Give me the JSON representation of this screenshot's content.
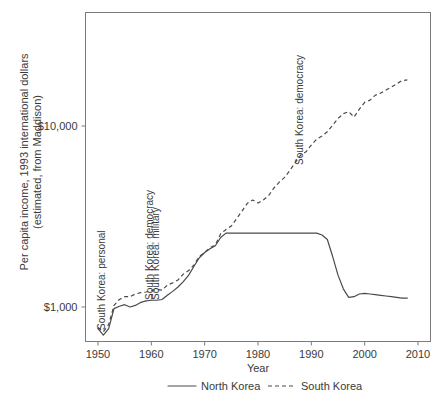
{
  "chart_data": {
    "type": "line",
    "title": "",
    "xlabel": "Year",
    "ylabel": "Per capita income, 1993 international dollars (estimated, from Maddison)",
    "ylabel_line1": "Per capita income, 1993 international dollars",
    "ylabel_line2": "(estimated, from Maddison)",
    "yscale": "log",
    "xlim": [
      1948,
      2012
    ],
    "ylim": [
      600,
      30000
    ],
    "grid": false,
    "legend_position": "bottom",
    "xticks": [
      1950,
      1960,
      1970,
      1980,
      1990,
      2000,
      2010
    ],
    "xticklabels": [
      "1950",
      "1960",
      "1970",
      "1980",
      "1990",
      "2000",
      "2010"
    ],
    "yticks": [
      1000,
      10000
    ],
    "yticklabels": [
      "$1,000",
      "$10,000"
    ],
    "legend": [
      {
        "name": "North Korea",
        "style": "solid"
      },
      {
        "name": "South Korea",
        "style": "dashed"
      }
    ],
    "annotations": [
      {
        "text": "South Korea: personal",
        "year": 1951,
        "rotation": -90
      },
      {
        "text": "South Korea: democracy",
        "year": 1960,
        "rotation": -90
      },
      {
        "text": "South Korea: military",
        "year": 1961,
        "rotation": -90
      },
      {
        "text": "South Korea: democracy",
        "year": 1988,
        "rotation": -90
      }
    ],
    "series": [
      {
        "name": "North Korea",
        "style": "solid",
        "x": [
          1950,
          1951,
          1952,
          1953,
          1954,
          1955,
          1956,
          1957,
          1958,
          1959,
          1960,
          1961,
          1962,
          1963,
          1964,
          1965,
          1966,
          1967,
          1968,
          1969,
          1970,
          1971,
          1972,
          1973,
          1974,
          1975,
          1976,
          1977,
          1978,
          1979,
          1980,
          1981,
          1982,
          1983,
          1984,
          1985,
          1986,
          1987,
          1988,
          1989,
          1990,
          1991,
          1992,
          1993,
          1994,
          1995,
          1996,
          1997,
          1998,
          1999,
          2000,
          2001,
          2002,
          2003,
          2004,
          2005,
          2006,
          2007,
          2008
        ],
        "y": [
          760,
          700,
          760,
          980,
          1010,
          1030,
          1000,
          1020,
          1060,
          1080,
          1090,
          1090,
          1100,
          1160,
          1220,
          1290,
          1380,
          1500,
          1680,
          1870,
          2000,
          2100,
          2180,
          2420,
          2560,
          2560,
          2560,
          2560,
          2560,
          2560,
          2560,
          2560,
          2560,
          2560,
          2560,
          2560,
          2560,
          2560,
          2560,
          2560,
          2560,
          2560,
          2500,
          2360,
          1900,
          1500,
          1260,
          1130,
          1140,
          1180,
          1190,
          1180,
          1170,
          1160,
          1150,
          1140,
          1130,
          1120,
          1120
        ]
      },
      {
        "name": "South Korea",
        "style": "dashed",
        "x": [
          1950,
          1951,
          1952,
          1953,
          1954,
          1955,
          1956,
          1957,
          1958,
          1959,
          1960,
          1961,
          1962,
          1963,
          1964,
          1965,
          1966,
          1967,
          1968,
          1969,
          1970,
          1971,
          1972,
          1973,
          1974,
          1975,
          1976,
          1977,
          1978,
          1979,
          1980,
          1981,
          1982,
          1983,
          1984,
          1985,
          1986,
          1987,
          1988,
          1989,
          1990,
          1991,
          1992,
          1993,
          1994,
          1995,
          1996,
          1997,
          1998,
          1999,
          2000,
          2001,
          2002,
          2003,
          2004,
          2005,
          2006,
          2007,
          2008
        ],
        "y": [
          770,
          730,
          800,
          1020,
          1100,
          1140,
          1140,
          1180,
          1200,
          1210,
          1230,
          1250,
          1240,
          1320,
          1360,
          1410,
          1520,
          1590,
          1710,
          1900,
          2000,
          2130,
          2200,
          2540,
          2680,
          2800,
          3080,
          3390,
          3740,
          3900,
          3750,
          3900,
          4130,
          4550,
          4900,
          5200,
          5700,
          6300,
          6900,
          7200,
          7850,
          8450,
          8800,
          9300,
          10100,
          11000,
          11700,
          12000,
          11200,
          12400,
          13500,
          13900,
          14800,
          15200,
          15800,
          16400,
          17100,
          17800,
          18000
        ]
      }
    ]
  },
  "legend_text": {
    "north_korea": "North Korea",
    "south_korea": "South Korea"
  }
}
